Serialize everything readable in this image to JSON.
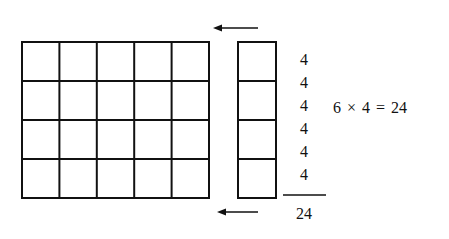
{
  "diagram": {
    "grid": {
      "rows": 4,
      "cols": 5,
      "x": 22,
      "y": 42,
      "width": 187,
      "height": 156
    },
    "column_strip": {
      "rows": 4,
      "x": 238,
      "y": 42,
      "width": 38,
      "height": 156
    },
    "arrows": [
      {
        "name": "top-arrow",
        "x1": 258,
        "x2": 213,
        "y": 28
      },
      {
        "name": "bottom-arrow",
        "x1": 258,
        "x2": 217,
        "y": 212
      }
    ],
    "addends": [
      "4",
      "4",
      "4",
      "4",
      "4",
      "4"
    ],
    "sum": "24",
    "equation": "6 × 4 = 24",
    "stroke_color": "#111111"
  }
}
